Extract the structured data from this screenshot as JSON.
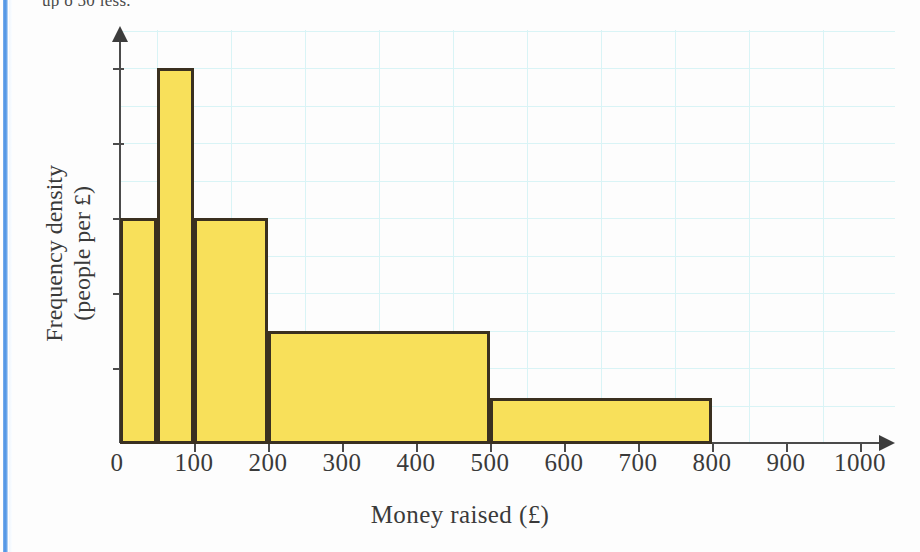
{
  "page": {
    "top_cut_text": "up o 50 less.",
    "background": "#fdfdfd",
    "edge_stripe_color": "#4a90e2"
  },
  "axes": {
    "x_title": "Money raised (£)",
    "y_title_line1": "Frequency density",
    "y_title_line2": "(people per £)",
    "x_tick_labels": [
      "0",
      "100",
      "200",
      "300",
      "400",
      "500",
      "600",
      "700",
      "800",
      "900",
      "1000"
    ],
    "x_tick_values": [
      0,
      100,
      200,
      300,
      400,
      500,
      600,
      700,
      800,
      900,
      1000
    ],
    "y_tick_count": 5,
    "axis_color": "#4b4b4b",
    "grid_color": "#d9f4f6"
  },
  "chart_data": {
    "type": "bar",
    "title": "",
    "subtitle": "",
    "xlabel": "Money raised (£)",
    "ylabel": "Frequency density (people per £)",
    "bin_edges": [
      0,
      50,
      100,
      200,
      500,
      800
    ],
    "bin_labels": [
      "0-50",
      "50-100",
      "100-200",
      "200-500",
      "500-800"
    ],
    "values": [
      3.0,
      5.0,
      3.0,
      1.5,
      0.6
    ],
    "xlim": [
      0,
      1000
    ],
    "ylim": [
      0,
      5.5
    ],
    "grid": true,
    "legend": "none",
    "bar_fill": "#f8e05a",
    "bar_edge": "#3a3020"
  }
}
